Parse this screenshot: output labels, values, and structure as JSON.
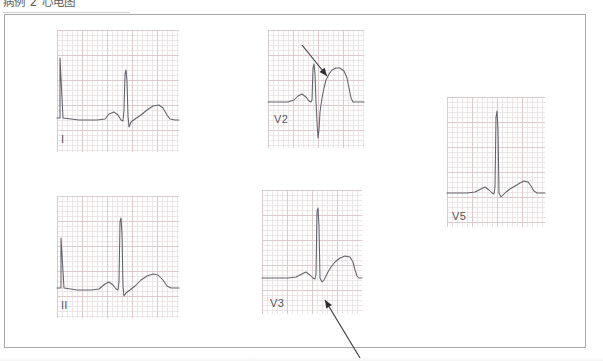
{
  "caption": {
    "text": "病例 2 心电图"
  },
  "figure": {
    "kind": "ecg-strip-collection",
    "frame_border_color": "#a9a9a9",
    "grid_major_color": "#d6c6c8",
    "grid_minor_color": "#e8dee0",
    "trace_color": "#5e5e66",
    "arrow_color": "#2e2e32"
  },
  "panels": [
    {
      "id": "lead-i",
      "label": "I",
      "x": 57,
      "y": 30,
      "width": 122,
      "height": 122,
      "label_x": 4,
      "label_y": 104,
      "trace": "M0,88 L3,88 L3,28 L6,88 L22,90 L40,90 L48,89 L52,84 L57,82 L61,85 L64,90 L66,91 L67,80 L68,44 L69,40 L70,52 L71,86 L72,97 L74,92 L78,89 L84,85 L90,80 L96,76 L102,75 L106,78 L110,85 L113,89 L118,90 L122,90",
      "annotations": []
    },
    {
      "id": "lead-ii",
      "label": "II",
      "x": 57,
      "y": 196,
      "width": 122,
      "height": 122,
      "label_x": 4,
      "label_y": 104,
      "trace": "M0,92 L4,92 L4,42 L7,92 L20,94 L34,94 L42,93 L48,88 L52,86 L56,89 L59,93 L61,94 L62,86 L63,26 L64,22 L65,38 L66,90 L67,100 L69,97 L73,94 L78,90 L84,84 L90,80 L96,78 L101,79 L106,84 L110,90 L114,92 L122,92",
      "annotations": []
    },
    {
      "id": "lead-v2",
      "label": "V2",
      "x": 268,
      "y": 30,
      "width": 96,
      "height": 118,
      "label_x": 6,
      "label_y": 84,
      "trace": "M0,72 L12,72 L20,72 L26,70 L30,66 L34,64 L38,67 L41,71 L43,72 L44,70 L45,38 L46,34 L47,44 L48,72 L49,92 L50,108 L51,100 L52,82 L54,68 L56,58 L58,50 L61,44 L64,40 L68,38 L72,38 L76,41 L79,48 L81,58 L83,68 L85,72 L90,72 L96,72",
      "annotations": [
        {
          "id": "v2-st-arrow",
          "name": "st-segment-arrow",
          "x1": 34,
          "y1": 15,
          "x2": 59,
          "y2": 46,
          "head_angle_deg": 51
        }
      ]
    },
    {
      "id": "lead-v3",
      "label": "V3",
      "x": 262,
      "y": 190,
      "width": 100,
      "height": 124,
      "label_x": 8,
      "label_y": 108,
      "trace": "M0,88 L14,88 L26,88 L34,87 L40,84 L44,82 L48,85 L51,88 L53,89 L54,84 L55,22 L56,18 L57,36 L58,88 L60,92 L62,90 L64,86 L66,82 L69,77 L73,72 L78,68 L83,66 L88,67 L91,72 L93,80 L95,86 L97,88 L100,88",
      "annotations": [
        {
          "id": "v3-st-arrow",
          "name": "st-junction-arrow",
          "x1": 98,
          "y1": 168,
          "x2": 63,
          "y2": 110,
          "head_angle_deg": 239
        }
      ]
    },
    {
      "id": "lead-v5",
      "label": "V5",
      "x": 447,
      "y": 97,
      "width": 98,
      "height": 130,
      "label_x": 5,
      "label_y": 114,
      "trace": "M0,96 L10,96 L20,96 L28,95 L34,92 L38,90 L42,93 L45,96 L47,97 L48,90 L49,20 L50,14 L51,32 L52,96 L54,100 L56,98 L59,95 L63,92 L68,89 L73,86 L77,84 L81,85 L84,89 L87,94 L90,96 L98,96",
      "annotations": []
    }
  ]
}
